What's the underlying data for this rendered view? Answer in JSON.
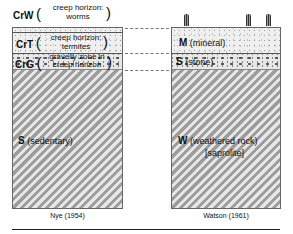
{
  "left_profile": {
    "caption": "Nye (1954)",
    "layers": [
      {
        "code": "CrW",
        "description_line1": "creep horizon:",
        "description_line2": "worms"
      },
      {
        "code": "CrT",
        "description_line1": "creep horizon:",
        "description_line2": "termites"
      },
      {
        "code": "CrG",
        "description_line1": "gravelly zone in",
        "description_line2": "creep horizon"
      },
      {
        "code": "S",
        "description": "(sedentary)"
      }
    ]
  },
  "right_profile": {
    "caption": "Watson (1961)",
    "layers": [
      {
        "code": "M",
        "description": "(mineral)"
      },
      {
        "code": "S",
        "description": "(stone)"
      },
      {
        "code": "W",
        "description": "(weathered rock)",
        "description_line2": "[saprolite]"
      }
    ]
  },
  "symbols": {
    "open_paren": "(",
    "close_paren": ")"
  },
  "colors": {
    "border": "#666666",
    "hatch_dark": "#9d9d9d",
    "hatch_light": "#e6e6e6",
    "background": "#ffffff"
  }
}
